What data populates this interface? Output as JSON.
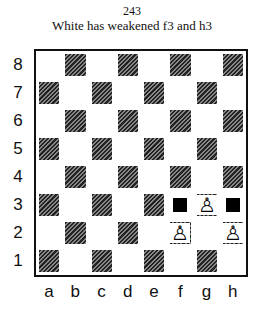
{
  "diagram": {
    "number": "243",
    "caption": "White has weakened f3 and h3",
    "ranks": [
      "8",
      "7",
      "6",
      "5",
      "4",
      "3",
      "2",
      "1"
    ],
    "files": [
      "a",
      "b",
      "c",
      "d",
      "e",
      "f",
      "g",
      "h"
    ],
    "pieces": [
      {
        "square": "f3",
        "type": "marker",
        "color": "black"
      },
      {
        "square": "h3",
        "type": "marker",
        "color": "black"
      },
      {
        "square": "g3",
        "type": "pawn",
        "color": "white",
        "glyph": "♙"
      },
      {
        "square": "f2",
        "type": "pawn",
        "color": "white",
        "glyph": "♙"
      },
      {
        "square": "h2",
        "type": "pawn",
        "color": "white",
        "glyph": "♙"
      }
    ]
  }
}
